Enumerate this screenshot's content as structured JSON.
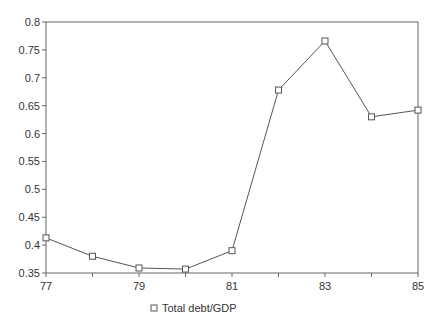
{
  "chart_data": {
    "type": "line",
    "title": "",
    "xlabel": "",
    "ylabel": "",
    "x": [
      77,
      78,
      79,
      80,
      81,
      82,
      83,
      84,
      85
    ],
    "series": [
      {
        "name": "Total debt/GDP",
        "marker": "square",
        "values": [
          0.413,
          0.38,
          0.359,
          0.357,
          0.39,
          0.678,
          0.766,
          0.63,
          0.642
        ]
      }
    ],
    "xlim": [
      77,
      85
    ],
    "ylim": [
      0.35,
      0.8
    ],
    "x_ticks": [
      77,
      78,
      79,
      80,
      81,
      82,
      83,
      84,
      85
    ],
    "x_tick_labels": [
      "77",
      "",
      "79",
      "",
      "81",
      "",
      "83",
      "",
      "85"
    ],
    "y_ticks": [
      0.35,
      0.4,
      0.45,
      0.5,
      0.55,
      0.6,
      0.65,
      0.7,
      0.75,
      0.8
    ],
    "y_tick_labels": [
      "0.35",
      "0.4",
      "0.45",
      "0.5",
      "0.55",
      "0.6",
      "0.65",
      "0.7",
      "0.75",
      "0.8"
    ],
    "grid": false,
    "legend": {
      "entries": [
        "Total debt/GDP"
      ],
      "placement": "bottom-center"
    },
    "colors": {
      "line": "#555555",
      "axis": "#666666",
      "text": "#333333"
    }
  }
}
